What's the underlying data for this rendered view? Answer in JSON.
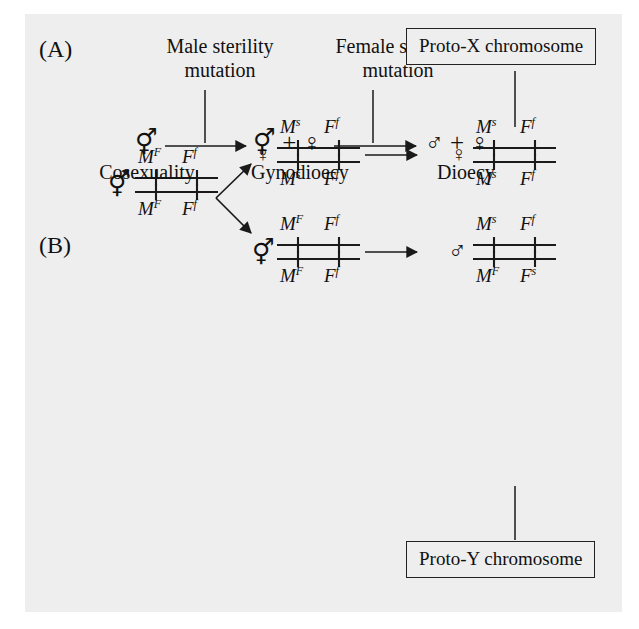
{
  "figure": {
    "panel_a": {
      "tag": "(A)",
      "annotations": [
        {
          "line1": "Male sterility",
          "line2": "mutation"
        },
        {
          "line1": "Female sterility",
          "line2": "mutation"
        }
      ],
      "stages": [
        {
          "symbols": "⚥",
          "symbol_name": "cosexual-symbol",
          "label": "Cosexuality"
        },
        {
          "symbols": "⚥ + ♀",
          "symbol_name": "cosexual-plus-female-symbol",
          "label": "Gynodioecy"
        },
        {
          "symbols": "♂ + ♀",
          "symbol_name": "male-plus-female-symbol",
          "label": "Dioecy"
        }
      ]
    },
    "panel_b": {
      "tag": "(B)",
      "callouts": [
        {
          "text": "Proto-X chromosome"
        },
        {
          "text": "Proto-Y chromosome"
        }
      ],
      "genotypes": [
        {
          "id": "founder",
          "sex_symbol": "⚥",
          "sex_name": "cosexual-symbol",
          "top": [
            {
              "gene": "M",
              "allele": "F"
            },
            {
              "gene": "F",
              "allele": "f"
            }
          ],
          "bottom": [
            {
              "gene": "M",
              "allele": "F"
            },
            {
              "gene": "F",
              "allele": "f"
            }
          ]
        },
        {
          "id": "mid-female",
          "sex_symbol": "♀",
          "sex_name": "female-symbol",
          "top": [
            {
              "gene": "M",
              "allele": "s"
            },
            {
              "gene": "F",
              "allele": "f"
            }
          ],
          "bottom": [
            {
              "gene": "M",
              "allele": "s"
            },
            {
              "gene": "F",
              "allele": "f"
            }
          ]
        },
        {
          "id": "mid-cosexual",
          "sex_symbol": "⚥",
          "sex_name": "cosexual-symbol",
          "top": [
            {
              "gene": "M",
              "allele": "F"
            },
            {
              "gene": "F",
              "allele": "f"
            }
          ],
          "bottom": [
            {
              "gene": "M",
              "allele": "F"
            },
            {
              "gene": "F",
              "allele": "f"
            }
          ]
        },
        {
          "id": "proto-x-female",
          "sex_symbol": "♀",
          "sex_name": "female-symbol",
          "top": [
            {
              "gene": "M",
              "allele": "s"
            },
            {
              "gene": "F",
              "allele": "f"
            }
          ],
          "bottom": [
            {
              "gene": "M",
              "allele": "s"
            },
            {
              "gene": "F",
              "allele": "f"
            }
          ]
        },
        {
          "id": "proto-y-male",
          "sex_symbol": "♂",
          "sex_name": "male-symbol",
          "top": [
            {
              "gene": "M",
              "allele": "s"
            },
            {
              "gene": "F",
              "allele": "f"
            }
          ],
          "bottom": [
            {
              "gene": "M",
              "allele": "F"
            },
            {
              "gene": "F",
              "allele": "s"
            }
          ]
        }
      ]
    }
  },
  "colors": {
    "background": "#eeeeee",
    "page": "#ffffff",
    "ink": "#1a1a1a"
  }
}
